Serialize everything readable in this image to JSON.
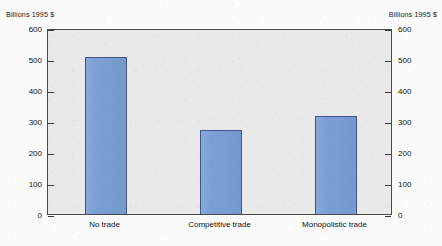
{
  "chart_data": {
    "type": "bar",
    "title": "",
    "xlabel": "",
    "ylabel": "Billions 1995 $",
    "ylabel_right": "Billions 1995 $",
    "categories": [
      "No trade",
      "Competitive trade",
      "Monopolistic trade"
    ],
    "values": [
      505,
      272,
      317
    ],
    "ylim": [
      0,
      600
    ],
    "yticks": [
      0,
      100,
      200,
      300,
      400,
      500,
      600
    ],
    "ytick_labels": [
      "0",
      "100",
      "200",
      "300",
      "400",
      "500",
      "600"
    ],
    "grid": false,
    "legend": false,
    "bar_color": "#7b9fd4",
    "bar_border_color": "#41568f",
    "plot_background": "#e9e9e9",
    "axis_color": "#4a4a4a"
  }
}
